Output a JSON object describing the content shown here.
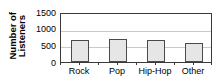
{
  "chart_data": {
    "type": "bar",
    "title": "",
    "xlabel": "",
    "ylabel": "Number of Listeners",
    "ylabel_lines": [
      "Number of",
      "Listeners"
    ],
    "categories": [
      "Rock",
      "Pop",
      "Hip-Hop",
      "Other"
    ],
    "values": [
      660,
      680,
      650,
      570
    ],
    "ylim": [
      0,
      1500
    ],
    "yticks": [
      0,
      500,
      1000,
      1500
    ],
    "ytick_labels": [
      "0",
      "500",
      "1000",
      "1500"
    ],
    "gridlines": [
      500,
      1000
    ],
    "grid": true,
    "legend": null,
    "legend_position": "none",
    "bar_fill_color": "#e6e6e6",
    "bar_edge_color": "#4a4a4a",
    "axis_color": "#3a3a3a",
    "grid_color": "#c9c9c9"
  }
}
